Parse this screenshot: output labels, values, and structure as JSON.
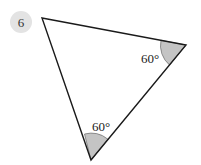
{
  "question": {
    "number": "6",
    "badge_color": "#e3e3e3"
  },
  "diagram": {
    "shape": "triangle",
    "vertices": {
      "top_left": [
        42,
        18
      ],
      "right": [
        186,
        45
      ],
      "bottom": [
        91,
        160
      ]
    },
    "angles": [
      {
        "vertex": "right",
        "label": "60°",
        "marked": true
      },
      {
        "vertex": "bottom",
        "label": "60°",
        "marked": true
      }
    ],
    "arc_fill": "#c4c4c4",
    "stroke": "#1a1a1a"
  }
}
